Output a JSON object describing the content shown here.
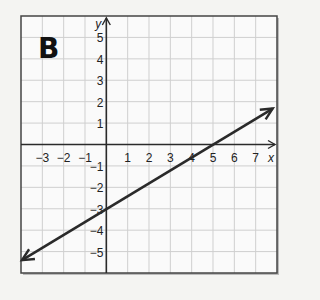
{
  "panel_label": "B",
  "chart_data": {
    "type": "line",
    "title": "B",
    "xlabel": "x",
    "ylabel": "y",
    "xlim": [
      -4,
      8
    ],
    "ylim": [
      -6,
      6
    ],
    "grid": true,
    "x_ticks": [
      -3,
      -2,
      -1,
      1,
      2,
      3,
      4,
      5,
      6,
      7
    ],
    "y_ticks": [
      5,
      4,
      3,
      2,
      1,
      -1,
      -2,
      -3,
      -4,
      -5
    ],
    "series": [
      {
        "name": "line",
        "equation": "y = 0.6x - 3",
        "slope": 0.6,
        "intercept": -3,
        "points": [
          [
            -4,
            -5.4
          ],
          [
            0,
            -3
          ],
          [
            5,
            0
          ],
          [
            7.8,
            1.68
          ]
        ],
        "arrows": "both"
      }
    ]
  },
  "colors": {
    "background": "#f4f4f2",
    "grid": "#cfcfcf",
    "axis": "#2a2a2a",
    "line": "#2a2a2a",
    "frame": "#444444"
  }
}
